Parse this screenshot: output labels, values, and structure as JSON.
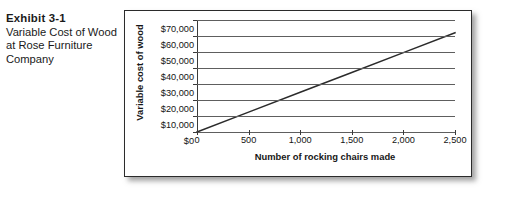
{
  "caption": {
    "exhibit_label": "Exhibit 3-1",
    "description": "Variable Cost of Wood at Rose Furniture Company"
  },
  "chart_data": {
    "type": "line",
    "title": "",
    "xlabel": "Number of rocking chairs made",
    "ylabel": "Variable cost of wood",
    "xlim": [
      0,
      2500
    ],
    "ylim": [
      0,
      70000
    ],
    "grid": true,
    "legend": false,
    "x_ticks": [
      0,
      500,
      1000,
      1500,
      2000,
      2500
    ],
    "x_tick_labels": [
      "0",
      "500",
      "1,000",
      "1,500",
      "2,000",
      "2,500"
    ],
    "y_ticks": [
      0,
      10000,
      20000,
      30000,
      40000,
      50000,
      60000,
      70000
    ],
    "y_tick_labels": [
      "$0",
      "$10,000",
      "$20,000",
      "$30,000",
      "$40,000",
      "$50,000",
      "$60,000",
      "$70,000"
    ],
    "series": [
      {
        "name": "Variable cost of wood",
        "x": [
          0,
          500,
          1000,
          1500,
          2000,
          2500
        ],
        "values": [
          0,
          12400,
          24800,
          37200,
          49600,
          62000
        ],
        "color": "#2b2b2b",
        "unit_rate": 24.8
      }
    ]
  },
  "colors": {
    "panel_border": "#2b2b2b",
    "gridline": "#5e5e5e",
    "axis": "#3a3a3a",
    "line": "#2b2b2b",
    "text": "#141414",
    "background": "#ffffff"
  }
}
